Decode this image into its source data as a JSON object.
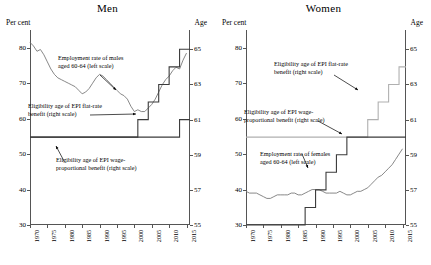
{
  "chart_data": [
    {
      "type": "line",
      "title": "Men",
      "ylabel_left": "Per cent",
      "ylabel_right": "Age",
      "xlabel": "",
      "xlim": [
        1970,
        2016
      ],
      "ylim_left": [
        30,
        85
      ],
      "ylim_right": [
        55,
        66.1
      ],
      "yticks_left": [
        30,
        40,
        50,
        60,
        70,
        80
      ],
      "yticks_right": [
        55,
        57,
        59,
        61,
        63,
        65
      ],
      "xticks": [
        "1970",
        "1975",
        "1980",
        "1985",
        "1990",
        "1995",
        "2000",
        "2005",
        "2010",
        "2015"
      ],
      "grid": false,
      "legend": "annotations",
      "series": [
        {
          "name": "Employment rate of males aged 60-64 (left scale)",
          "axis": "left",
          "color": "#7a7a7a",
          "x": [
            1970,
            1971,
            1972,
            1973,
            1974,
            1975,
            1976,
            1977,
            1978,
            1979,
            1980,
            1981,
            1982,
            1983,
            1984,
            1985,
            1986,
            1987,
            1988,
            1989,
            1990,
            1991,
            1992,
            1993,
            1994,
            1995,
            1996,
            1997,
            1998,
            1999,
            2000,
            2001,
            2002,
            2003,
            2004,
            2005,
            2006,
            2007,
            2008,
            2009,
            2010,
            2011,
            2012,
            2013,
            2014,
            2015
          ],
          "values": [
            81.5,
            80.5,
            79.0,
            79.5,
            78.0,
            76.0,
            74.0,
            72.5,
            71.5,
            71.0,
            70.5,
            70.0,
            69.5,
            69.0,
            68.0,
            67.0,
            67.5,
            68.5,
            70.0,
            71.5,
            72.5,
            72.0,
            71.0,
            70.0,
            69.0,
            68.0,
            67.0,
            66.5,
            65.5,
            63.5,
            62.0,
            62.5,
            62.0,
            62.0,
            63.0,
            64.0,
            65.5,
            67.5,
            69.5,
            71.0,
            72.0,
            73.5,
            74.5,
            74.0,
            76.5,
            78.5
          ]
        },
        {
          "name": "Eligibility age of EPI flat-rate benefit (right scale)",
          "axis": "right",
          "color": "#3b3b3b",
          "x": [
            1970,
            2000,
            2000,
            2001,
            2001,
            2004,
            2004,
            2007,
            2007,
            2010,
            2010,
            2013,
            2013,
            2016
          ],
          "values": [
            60,
            60,
            60,
            60,
            61,
            61,
            62,
            62,
            63,
            63,
            64,
            64,
            65,
            65
          ]
        },
        {
          "name": "Eligibility age of EPI wage-proportional benefit (right scale)",
          "axis": "right",
          "color": "#3b3b3b",
          "x": [
            1970,
            2013,
            2013,
            2016
          ],
          "values": [
            60,
            60,
            61,
            61
          ]
        }
      ],
      "annotations": [
        {
          "text": "Employment rate of males aged 60-64 (left scale)",
          "x": 1983,
          "y": 75
        },
        {
          "text": "Eligibility age of EPI flat-rate benefit (right scale)",
          "x": 1976,
          "y": 59
        },
        {
          "text": "Eligibility age of EPI wage-proportional benefit (right scale)",
          "x": 1980,
          "y": 46
        }
      ]
    },
    {
      "type": "line",
      "title": "Women",
      "ylabel_left": "Per cent",
      "ylabel_right": "Age",
      "xlabel": "",
      "xlim": [
        1970,
        2016
      ],
      "ylim_left": [
        30,
        85
      ],
      "ylim_right": [
        55,
        66.1
      ],
      "yticks_left": [
        30,
        40,
        50,
        60,
        70,
        80
      ],
      "yticks_right": [
        55,
        57,
        59,
        61,
        63,
        65
      ],
      "xticks": [
        "1970",
        "1975",
        "1980",
        "1985",
        "1990",
        "1995",
        "2000",
        "2005",
        "2010",
        "2015"
      ],
      "grid": false,
      "legend": "annotations",
      "series": [
        {
          "name": "Employment rate of females aged 60-64 (left scale)",
          "axis": "left",
          "color": "#7a7a7a",
          "x": [
            1970,
            1971,
            1972,
            1973,
            1974,
            1975,
            1976,
            1977,
            1978,
            1979,
            1980,
            1981,
            1982,
            1983,
            1984,
            1985,
            1986,
            1987,
            1988,
            1989,
            1990,
            1991,
            1992,
            1993,
            1994,
            1995,
            1996,
            1997,
            1998,
            1999,
            2000,
            2001,
            2002,
            2003,
            2004,
            2005,
            2006,
            2007,
            2008,
            2009,
            2010,
            2011,
            2012,
            2013,
            2014,
            2015
          ],
          "values": [
            39.5,
            39.0,
            39.0,
            39.0,
            38.5,
            38.0,
            37.5,
            37.5,
            38.0,
            38.5,
            38.5,
            38.5,
            38.5,
            39.0,
            39.0,
            38.5,
            38.5,
            39.0,
            39.5,
            40.0,
            40.0,
            40.0,
            39.5,
            39.0,
            39.0,
            39.0,
            39.0,
            39.5,
            39.0,
            38.5,
            38.5,
            39.0,
            39.5,
            39.5,
            40.0,
            40.5,
            41.5,
            42.5,
            43.5,
            44.0,
            45.0,
            46.0,
            47.0,
            48.5,
            50.0,
            51.5
          ]
        },
        {
          "name": "Eligibility age of EPI flat-rate benefit (right scale)",
          "axis": "right",
          "color": "#b0b0b0",
          "x": [
            1970,
            2005,
            2005,
            2008,
            2008,
            2011,
            2011,
            2014,
            2014,
            2016
          ],
          "values": [
            60,
            60,
            61,
            61,
            62,
            62,
            63,
            63,
            64,
            64
          ]
        },
        {
          "name": "Eligibility age of EPI wage-proportional benefit (right scale)",
          "axis": "right",
          "color": "#3b3b3b",
          "x": [
            1970,
            1987,
            1987,
            1990,
            1990,
            1993,
            1993,
            1996,
            1996,
            1999,
            1999,
            2016
          ],
          "values": [
            55,
            55,
            56,
            56,
            57,
            57,
            58,
            58,
            59,
            59,
            60,
            60
          ]
        }
      ],
      "annotations": [
        {
          "text": "Eligibility age of EPI flat-rate benefit (right scale)",
          "x": 1983,
          "y": 71
        },
        {
          "text": "Eligibility age of EPI wage-proportional benefit (right scale)",
          "x": 1975,
          "y": 56
        },
        {
          "text": "Employment rate of females aged 60-64 (left scale)",
          "x": 1980,
          "y": 44
        }
      ]
    }
  ],
  "panels": {
    "men": {
      "title": "Men",
      "left_axis_label": "Per cent",
      "right_axis_label": "Age",
      "annotations": {
        "a1": "Employment rate of males",
        "a1b": "aged 60-64 (left scale)",
        "a2": "Eligibility age of EPI flat-rate",
        "a2b": "benefit (right scale)",
        "a3": "Eligibility age of EPI wage-",
        "a3b": "proportional benefit (right scale)"
      }
    },
    "women": {
      "title": "Women",
      "left_axis_label": "Per cent",
      "right_axis_label": "Age",
      "annotations": {
        "a1": "Eligibility age of EPI flat-rate",
        "a1b": "benefit (right scale)",
        "a2": "Eligibility age of EPI wage-",
        "a2b": "proportional benefit (right scale)",
        "a3": "Employment rate of females",
        "a3b": "aged 60-64 (left scale)"
      }
    }
  }
}
